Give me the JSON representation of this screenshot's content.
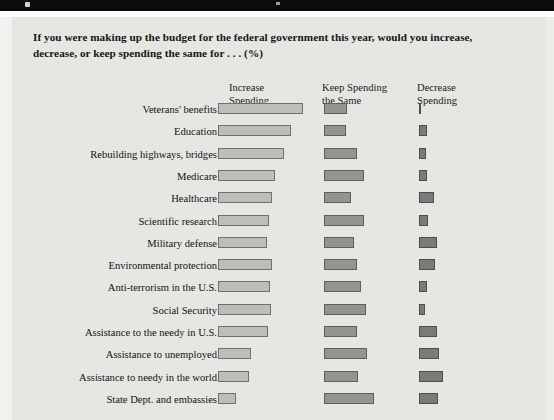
{
  "title": "If you were making up the budget for the federal government this year, would you increase, decrease, or keep spending the same for . . . (%)",
  "columns": {
    "increase": "Increase\nSpending",
    "keep": "Keep Spending\nthe Same",
    "decrease": "Decrease\nSpending"
  },
  "colors": {
    "panel_background": "#e6e6e3",
    "increase_bar": "#bdbdba",
    "keep_bar": "#949491",
    "decrease_bar": "#7b7b79",
    "bar_outline": "#6f6f6f",
    "title_text": "#161616",
    "top_band": "#0b0b0b"
  },
  "chart_data": {
    "type": "bar",
    "orientation": "horizontal",
    "title": "If you were making up the budget for the federal government this year, would you increase, decrease, or keep spending the same for . . . (%)",
    "xlabel": "",
    "ylabel": "",
    "units": "%",
    "grid": false,
    "legend_position": "top-as-column-headers",
    "xlim": [
      0,
      100
    ],
    "categories": [
      "Veterans' benefits",
      "Education",
      "Rebuilding highways, bridges",
      "Medicare",
      "Healthcare",
      "Scientific research",
      "Military defense",
      "Environmental protection",
      "Anti-terrorism in the U.S.",
      "Social Security",
      "Assistance to the needy in U.S.",
      "Assistance to unemployed",
      "Assistance to needy in the world",
      "State Dept. and embassies"
    ],
    "series": [
      {
        "name": "Increase Spending",
        "color": "#bdbdba",
        "values": [
          75,
          64,
          58,
          50,
          48,
          45,
          43,
          48,
          46,
          47,
          44,
          29,
          27,
          16
        ]
      },
      {
        "name": "Keep Spending the Same",
        "color": "#949491",
        "values": [
          20,
          19,
          29,
          35,
          24,
          35,
          26,
          29,
          33,
          37,
          29,
          38,
          30,
          44
        ]
      },
      {
        "name": "Decrease Spending",
        "color": "#7b7b79",
        "values": [
          2,
          7,
          6,
          7,
          13,
          8,
          16,
          14,
          7,
          5,
          16,
          18,
          21,
          17
        ]
      }
    ],
    "rows": [
      {
        "label": "Veterans' benefits",
        "increase": 75,
        "keep": 20,
        "decrease": 2
      },
      {
        "label": "Education",
        "increase": 64,
        "keep": 19,
        "decrease": 7
      },
      {
        "label": "Rebuilding highways, bridges",
        "increase": 58,
        "keep": 29,
        "decrease": 6
      },
      {
        "label": "Medicare",
        "increase": 50,
        "keep": 35,
        "decrease": 7
      },
      {
        "label": "Healthcare",
        "increase": 48,
        "keep": 24,
        "decrease": 13
      },
      {
        "label": "Scientific research",
        "increase": 45,
        "keep": 35,
        "decrease": 8
      },
      {
        "label": "Military defense",
        "increase": 43,
        "keep": 26,
        "decrease": 16
      },
      {
        "label": "Environmental protection",
        "increase": 48,
        "keep": 29,
        "decrease": 14
      },
      {
        "label": "Anti-terrorism in the U.S.",
        "increase": 46,
        "keep": 33,
        "decrease": 7
      },
      {
        "label": "Social Security",
        "increase": 47,
        "keep": 37,
        "decrease": 5
      },
      {
        "label": "Assistance to the needy in U.S.",
        "increase": 44,
        "keep": 29,
        "decrease": 16
      },
      {
        "label": "Assistance to unemployed",
        "increase": 29,
        "keep": 38,
        "decrease": 18
      },
      {
        "label": "Assistance to needy in the world",
        "increase": 27,
        "keep": 30,
        "decrease": 21
      },
      {
        "label": "State Dept. and embassies",
        "increase": 16,
        "keep": 44,
        "decrease": 17
      }
    ]
  }
}
